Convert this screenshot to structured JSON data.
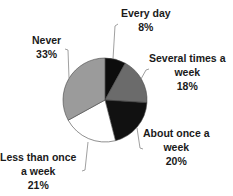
{
  "chart_data": {
    "type": "pie",
    "title": "",
    "categories": [
      "Every day",
      "Several times a week",
      "About once a week",
      "Less than once a week",
      "Never"
    ],
    "values": [
      8,
      18,
      20,
      21,
      33
    ],
    "unit": "%",
    "start_angle": "12 o'clock",
    "direction": "clockwise",
    "colors": [
      "#0d0d0d",
      "#6b6b6b",
      "#111111",
      "#ffffff",
      "#9b9b9b"
    ],
    "legend": "none (leader-line labels)",
    "labels": [
      {
        "line1": "Every day",
        "line2": "",
        "pct": "8%"
      },
      {
        "line1": "Several times a",
        "line2": "week",
        "pct": "18%"
      },
      {
        "line1": "About once a",
        "line2": "week",
        "pct": "20%"
      },
      {
        "line1": "Less than once",
        "line2": "a week",
        "pct": "21%"
      },
      {
        "line1": "Never",
        "line2": "",
        "pct": "33%"
      }
    ]
  }
}
